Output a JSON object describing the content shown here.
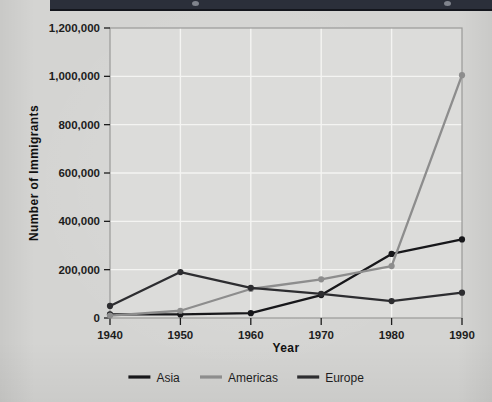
{
  "page": {
    "background_color": "#d4d4d2",
    "banner_color": "#2b2f3a"
  },
  "chart_data": {
    "type": "line",
    "title": "",
    "xlabel": "Year",
    "ylabel": "Number of Immigrants",
    "categories": [
      "1940",
      "1950",
      "1960",
      "1970",
      "1980",
      "1990"
    ],
    "x": [
      1940,
      1950,
      1960,
      1970,
      1980,
      1990
    ],
    "xlim": [
      1940,
      1990
    ],
    "ylim": [
      0,
      1200000
    ],
    "ytick_labels": [
      "0",
      "200,000",
      "400,000",
      "600,000",
      "800,000",
      "1,000,000",
      "1,200,000"
    ],
    "ytick_values": [
      0,
      200000,
      400000,
      600000,
      800000,
      1000000,
      1200000
    ],
    "grid": true,
    "legend_position": "bottom",
    "series": [
      {
        "name": "Asia",
        "color": "#17171a",
        "values": [
          15000,
          15000,
          20000,
          95000,
          265000,
          325000
        ]
      },
      {
        "name": "Americas",
        "color": "#8d8d8d",
        "values": [
          10000,
          30000,
          120000,
          160000,
          215000,
          1005000
        ]
      },
      {
        "name": "Europe",
        "color": "#2d2d30",
        "values": [
          50000,
          190000,
          125000,
          100000,
          70000,
          105000
        ]
      }
    ]
  },
  "legend": {
    "items": [
      {
        "label": "Asia",
        "color": "#17171a"
      },
      {
        "label": "Americas",
        "color": "#8d8d8d"
      },
      {
        "label": "Europe",
        "color": "#2d2d30"
      }
    ]
  },
  "axes": {
    "x_title": "Year",
    "y_title": "Number of Immigrants"
  }
}
